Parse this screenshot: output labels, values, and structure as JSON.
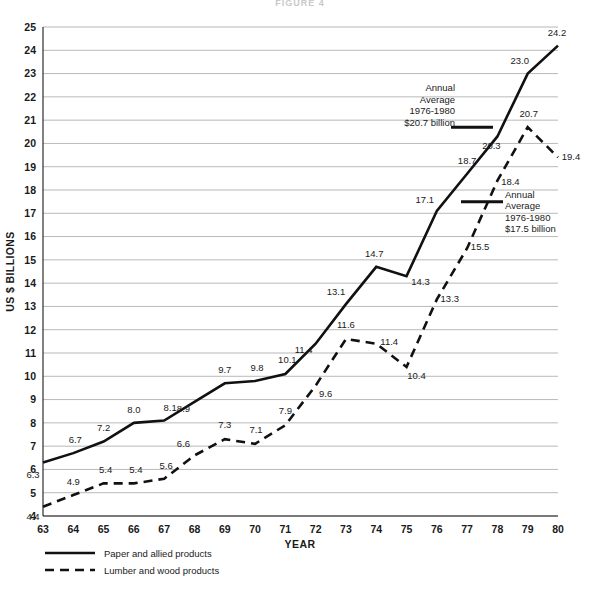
{
  "figure": {
    "title": "FIGURE 4"
  },
  "chart_data": {
    "type": "line",
    "title": "FIGURE 4",
    "xlabel": "YEAR",
    "ylabel": "US $ BILLIONS",
    "xlim": [
      63,
      80
    ],
    "ylim": [
      4,
      25
    ],
    "grid": true,
    "legend_position": "bottom-left",
    "categories": [
      "63",
      "64",
      "65",
      "66",
      "67",
      "68",
      "69",
      "70",
      "71",
      "72",
      "73",
      "74",
      "75",
      "76",
      "77",
      "78",
      "79",
      "80"
    ],
    "x": [
      1963,
      1964,
      1965,
      1966,
      1967,
      1968,
      1969,
      1970,
      1971,
      1972,
      1973,
      1974,
      1975,
      1976,
      1977,
      1978,
      1979,
      1980
    ],
    "y_ticks": [
      4,
      5,
      6,
      7,
      8,
      9,
      10,
      11,
      12,
      13,
      14,
      15,
      16,
      17,
      18,
      19,
      20,
      21,
      22,
      23,
      24,
      25
    ],
    "series": [
      {
        "name": "Paper and allied products",
        "style": "solid",
        "values": [
          6.3,
          6.7,
          7.2,
          8.0,
          8.1,
          8.9,
          9.7,
          9.8,
          10.1,
          11.4,
          13.1,
          14.7,
          14.3,
          17.1,
          18.7,
          20.3,
          23.0,
          24.2
        ],
        "labels": [
          "6.3",
          "6.7",
          "7.2",
          "8.0",
          "8.1",
          "8.9",
          "9.7",
          "9.8",
          "10.1",
          "11.4",
          "13.1",
          "14.7",
          "14.3",
          "17.1",
          "18.7",
          "20.3",
          "23.0",
          "24.2"
        ]
      },
      {
        "name": "Lumber and wood products",
        "style": "dashed",
        "values": [
          4.4,
          4.9,
          5.4,
          5.4,
          5.6,
          6.6,
          7.3,
          7.1,
          7.9,
          9.6,
          11.6,
          11.4,
          10.4,
          13.3,
          15.5,
          18.4,
          20.7,
          19.4
        ],
        "labels": [
          "4.4",
          "4.9",
          "5.4",
          "5.4",
          "5.6",
          "6.6",
          "7.3",
          "7.1",
          "7.9",
          "9.6",
          "11.6",
          "11.4",
          "10.4",
          "13.3",
          "15.5",
          "18.4",
          "20.7",
          "19.4"
        ]
      }
    ],
    "annotations": [
      {
        "id": "paper-annual-average",
        "series": "Paper and allied products",
        "value": 20.7,
        "lines": [
          "Annual",
          "Average",
          "1976-1980",
          "$20.7 billion"
        ]
      },
      {
        "id": "lumber-annual-average",
        "series": "Lumber and wood products",
        "value": 17.5,
        "lines": [
          "Annual",
          "Average",
          "1976-1980",
          "$17.5 billion"
        ]
      }
    ],
    "legend": [
      {
        "label": "Paper and allied products",
        "style": "solid"
      },
      {
        "label": "Lumber and wood products",
        "style": "dashed"
      }
    ]
  }
}
